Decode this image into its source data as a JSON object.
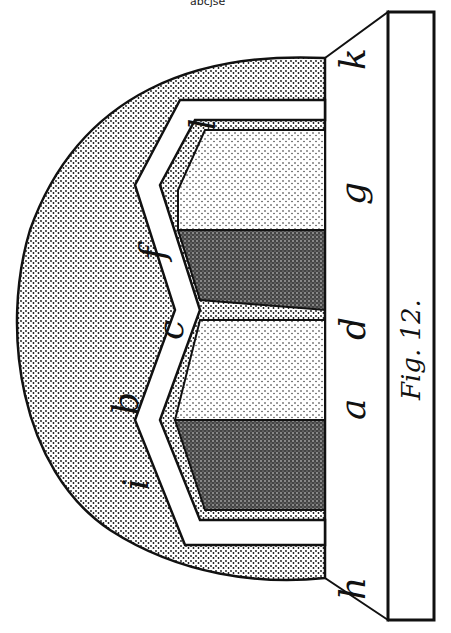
{
  "header": {
    "cut_text": "abcjse"
  },
  "figure": {
    "caption": "Fig. 12.",
    "labels_outer": [
      "i",
      "b",
      "c",
      "f",
      "l"
    ],
    "labels_inner": [
      "h",
      "a",
      "d",
      "g",
      "k"
    ],
    "colors": {
      "ink": "#111111",
      "paper": "#ffffff",
      "light_stipple": "#d6d6d6",
      "mid_stipple": "#b5b5b5",
      "dark_stipple": "#555555"
    }
  }
}
